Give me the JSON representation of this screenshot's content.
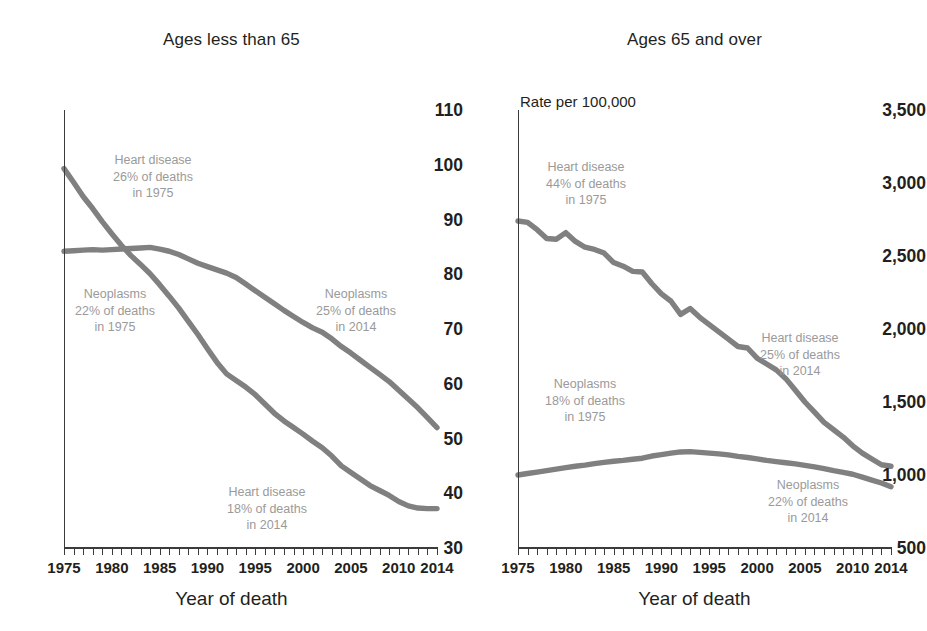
{
  "figure": {
    "line_color": "#808080",
    "annotation_color": "#9a9a9a",
    "axis_color": "#3b3b3b"
  },
  "panels": [
    {
      "key": "under65",
      "title": "Ages less than 65",
      "units_label": "",
      "xaxis_title": "Year of death",
      "yticks": [
        "110",
        "100",
        "90",
        "80",
        "70",
        "60",
        "50",
        "40",
        "30"
      ],
      "xticks": [
        "1975",
        "1980",
        "1985",
        "1990",
        "1995",
        "2000",
        "2005",
        "2010",
        "2014"
      ],
      "annotations": [
        {
          "name": "heart-1975",
          "lines": [
            "Heart disease",
            "26% of deaths",
            "in 1975"
          ]
        },
        {
          "name": "neoplasms-1975",
          "lines": [
            "Neoplasms",
            "22% of deaths",
            "in 1975"
          ]
        },
        {
          "name": "neoplasms-2014",
          "lines": [
            "Neoplasms",
            "25% of deaths",
            "in 2014"
          ]
        },
        {
          "name": "heart-2014",
          "lines": [
            "Heart disease",
            "18% of deaths",
            "in 2014"
          ]
        }
      ]
    },
    {
      "key": "over65",
      "title": "Ages 65 and over",
      "units_label": "Rate per 100,000",
      "xaxis_title": "Year of death",
      "yticks": [
        "3,500",
        "3,000",
        "2,500",
        "2,000",
        "1,500",
        "1,000",
        "500"
      ],
      "xticks": [
        "1975",
        "1980",
        "1985",
        "1990",
        "1995",
        "2000",
        "2005",
        "2010",
        "2014"
      ],
      "annotations": [
        {
          "name": "heart-1975",
          "lines": [
            "Heart disease",
            "44% of deaths",
            "in 1975"
          ]
        },
        {
          "name": "neoplasms-1975",
          "lines": [
            "Neoplasms",
            "18% of deaths",
            "in 1975"
          ]
        },
        {
          "name": "heart-2014",
          "lines": [
            "Heart disease",
            "25% of deaths",
            "in 2014"
          ]
        },
        {
          "name": "neoplasms-2014",
          "lines": [
            "Neoplasms",
            "22% of deaths",
            "in 2014"
          ]
        }
      ]
    }
  ],
  "chart_data": [
    {
      "type": "line",
      "title": "Ages less than 65",
      "xlabel": "Year of death",
      "ylabel": "Rate per 100,000",
      "xlim": [
        1975,
        2014
      ],
      "ylim": [
        30,
        110
      ],
      "ytick_step": 10,
      "grid": false,
      "legend": "annotations on plot",
      "x": [
        1975,
        1976,
        1977,
        1978,
        1979,
        1980,
        1981,
        1982,
        1983,
        1984,
        1985,
        1986,
        1987,
        1988,
        1989,
        1990,
        1991,
        1992,
        1993,
        1994,
        1995,
        1996,
        1997,
        1998,
        1999,
        2000,
        2001,
        2002,
        2003,
        2004,
        2005,
        2006,
        2007,
        2008,
        2009,
        2010,
        2011,
        2012,
        2013,
        2014
      ],
      "series": [
        {
          "name": "Heart disease",
          "values": [
            99.3,
            96.8,
            94.2,
            92.0,
            89.6,
            87.4,
            85.3,
            83.4,
            81.8,
            80.1,
            78.1,
            76.0,
            73.8,
            71.4,
            69.0,
            66.4,
            63.9,
            61.8,
            60.6,
            59.4,
            58.0,
            56.3,
            54.6,
            53.2,
            52.0,
            50.8,
            49.5,
            48.3,
            46.8,
            45.0,
            43.8,
            42.6,
            41.4,
            40.5,
            39.6,
            38.5,
            37.7,
            37.3,
            37.2,
            37.2
          ],
          "start_annotation": "26% of deaths in 1975",
          "end_annotation": "18% of deaths in 2014"
        },
        {
          "name": "Neoplasms",
          "values": [
            84.2,
            84.3,
            84.4,
            84.5,
            84.4,
            84.5,
            84.6,
            84.7,
            84.8,
            84.9,
            84.6,
            84.2,
            83.6,
            82.8,
            82.0,
            81.4,
            80.8,
            80.2,
            79.4,
            78.2,
            77.0,
            75.8,
            74.6,
            73.4,
            72.3,
            71.2,
            70.2,
            69.4,
            68.2,
            66.8,
            65.6,
            64.3,
            63.0,
            61.7,
            60.4,
            58.8,
            57.2,
            55.6,
            53.8,
            52.0
          ],
          "start_annotation": "22% of deaths in 1975",
          "end_annotation": "25% of deaths in 2014"
        }
      ]
    },
    {
      "type": "line",
      "title": "Ages 65 and over",
      "xlabel": "Year of death",
      "ylabel": "Rate per 100,000",
      "xlim": [
        1975,
        2014
      ],
      "ylim": [
        500,
        3500
      ],
      "ytick_step": 500,
      "grid": false,
      "legend": "annotations on plot",
      "x": [
        1975,
        1976,
        1977,
        1978,
        1979,
        1980,
        1981,
        1982,
        1983,
        1984,
        1985,
        1986,
        1987,
        1988,
        1989,
        1990,
        1991,
        1992,
        1993,
        1994,
        1995,
        1996,
        1997,
        1998,
        1999,
        2000,
        2001,
        2002,
        2003,
        2004,
        2005,
        2006,
        2007,
        2008,
        2009,
        2010,
        2011,
        2012,
        2013,
        2014
      ],
      "series": [
        {
          "name": "Heart disease",
          "values": [
            2740,
            2730,
            2680,
            2620,
            2615,
            2660,
            2600,
            2560,
            2545,
            2520,
            2455,
            2430,
            2395,
            2390,
            2310,
            2240,
            2190,
            2100,
            2140,
            2080,
            2030,
            1980,
            1930,
            1880,
            1870,
            1800,
            1760,
            1720,
            1660,
            1580,
            1500,
            1430,
            1360,
            1310,
            1260,
            1200,
            1150,
            1110,
            1070,
            1060
          ],
          "start_annotation": "44% of deaths in 1975",
          "end_annotation": "25% of deaths in 2014"
        },
        {
          "name": "Neoplasms",
          "values": [
            1000,
            1010,
            1020,
            1030,
            1040,
            1050,
            1060,
            1068,
            1078,
            1086,
            1094,
            1100,
            1108,
            1115,
            1130,
            1140,
            1150,
            1158,
            1160,
            1155,
            1150,
            1145,
            1138,
            1128,
            1120,
            1110,
            1100,
            1092,
            1084,
            1076,
            1066,
            1056,
            1044,
            1030,
            1018,
            1005,
            985,
            965,
            945,
            920
          ],
          "start_annotation": "18% of deaths in 1975",
          "end_annotation": "22% of deaths in 2014"
        }
      ]
    }
  ]
}
